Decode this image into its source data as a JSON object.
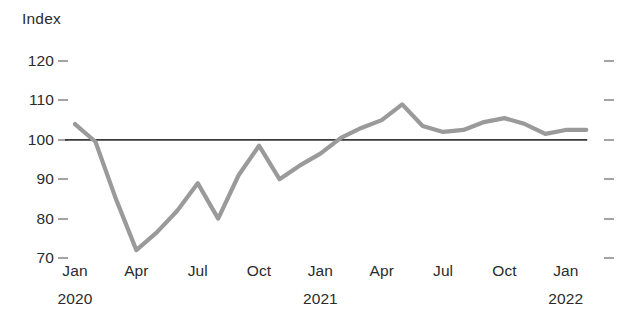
{
  "chart_data": {
    "type": "line",
    "title": "",
    "ylabel": "Index",
    "xlabel": "",
    "ylim": [
      65,
      124
    ],
    "xlim": [
      "2020-01",
      "2022-02"
    ],
    "grid": false,
    "legend": "none",
    "reference_line": {
      "value": 100,
      "label": "100",
      "color": "#3a3a3a"
    },
    "series_color": "#9a9a9a",
    "y_ticks": [
      120,
      110,
      100,
      90,
      80,
      70
    ],
    "y_tick_labels": [
      "120",
      "110",
      "100",
      "90",
      "80",
      "70"
    ],
    "x_tick_labels": [
      "Jan",
      "Apr",
      "Jul",
      "Oct",
      "Jan",
      "Apr",
      "Jul",
      "Oct",
      "Jan"
    ],
    "x_tick_keys": [
      "2020-01",
      "2020-04",
      "2020-07",
      "2020-10",
      "2021-01",
      "2021-04",
      "2021-07",
      "2021-10",
      "2022-01"
    ],
    "x_year_labels": [
      {
        "key": "2020-01",
        "label": "2020"
      },
      {
        "key": "2021-01",
        "label": "2021"
      },
      {
        "key": "2022-01",
        "label": "2022"
      }
    ],
    "x": [
      "2020-01",
      "2020-02",
      "2020-03",
      "2020-04",
      "2020-05",
      "2020-06",
      "2020-07",
      "2020-08",
      "2020-09",
      "2020-10",
      "2020-11",
      "2020-12",
      "2021-01",
      "2021-02",
      "2021-03",
      "2021-04",
      "2021-05",
      "2021-06",
      "2021-07",
      "2021-08",
      "2021-09",
      "2021-10",
      "2021-11",
      "2021-12",
      "2022-01",
      "2022-02"
    ],
    "values": [
      104.0,
      99.5,
      85.0,
      72.0,
      76.5,
      82.0,
      89.0,
      80.0,
      91.0,
      98.5,
      90.0,
      93.5,
      96.5,
      100.5,
      103.0,
      105.0,
      109.0,
      103.5,
      102.0,
      102.5,
      104.5,
      105.5,
      104.0,
      101.5,
      102.5,
      102.5
    ],
    "series_name": "Index"
  },
  "axis": {
    "y_title": "Index"
  }
}
